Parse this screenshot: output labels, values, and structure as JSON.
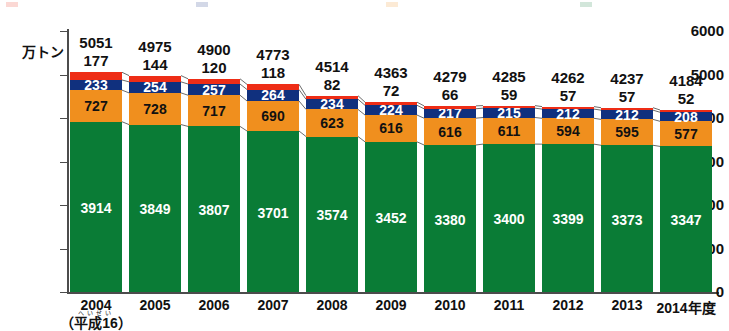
{
  "chart_data": {
    "type": "bar",
    "stacked": true,
    "title": "",
    "subtitle": "",
    "xlabel": "",
    "ylabel": "万トン",
    "ylim": [
      0,
      6000
    ],
    "ytick_labels": [
      "0",
      "1000",
      "2000",
      "3000",
      "4000",
      "5000",
      "6000"
    ],
    "yticks": [
      0,
      1000,
      2000,
      3000,
      4000,
      5000,
      6000
    ],
    "grid": false,
    "legend_position": "top",
    "categories": [
      "2004",
      "2005",
      "2006",
      "2007",
      "2008",
      "2009",
      "2010",
      "2011",
      "2012",
      "2013",
      "2014年度"
    ],
    "category_sub": "（平成16）",
    "category_sub_ruby": "へいせい",
    "series": [
      {
        "name": "green-segment",
        "color": "#0a7c36",
        "values": [
          3914,
          3849,
          3807,
          3701,
          3574,
          3452,
          3380,
          3400,
          3399,
          3373,
          3347
        ]
      },
      {
        "name": "orange-segment",
        "color": "#f08f1e",
        "values": [
          727,
          728,
          717,
          690,
          623,
          616,
          616,
          611,
          594,
          595,
          577
        ]
      },
      {
        "name": "navy-segment",
        "color": "#10307e",
        "values": [
          233,
          254,
          257,
          264,
          234,
          224,
          217,
          215,
          212,
          212,
          208
        ]
      },
      {
        "name": "red-segment",
        "color": "#ee2d16",
        "values": [
          177,
          144,
          120,
          118,
          82,
          72,
          66,
          59,
          57,
          57,
          52
        ]
      }
    ],
    "totals": [
      5051,
      4975,
      4900,
      4773,
      4514,
      4363,
      4279,
      4285,
      4262,
      4237,
      4184
    ],
    "total_label_position": "above-bar",
    "red_label_position": "above-bar"
  },
  "axis": {
    "unit": "万トン",
    "unit_name": "man-ton"
  },
  "legend": {
    "visible_partially": true,
    "items": [
      {
        "label": "",
        "color": "#ee2d16"
      },
      {
        "label": "",
        "color": "#10307e"
      },
      {
        "label": "",
        "color": "#f08f1e"
      },
      {
        "label": "",
        "color": "#0a7c36"
      }
    ]
  },
  "colors": {
    "green": "#0a7c36",
    "orange": "#f08f1e",
    "navy": "#10307e",
    "red": "#ee2d16",
    "axis": "#4c4c4c",
    "text": "#111111",
    "background": "#ffffff"
  }
}
